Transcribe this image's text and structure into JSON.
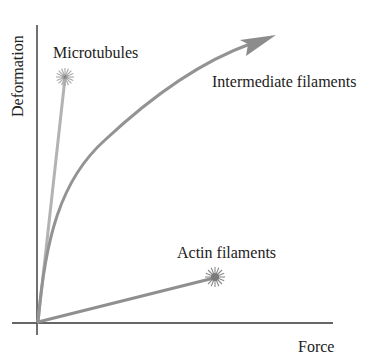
{
  "diagram": {
    "axes": {
      "x_label": "Force",
      "y_label": "Deformation",
      "axis_color": "#333333"
    },
    "curves": [
      {
        "name": "Microtubules",
        "label": "Microtubules",
        "shape": "straight line, steep, ends in burst (rupture)",
        "color": "#b3b3b3",
        "end_marker": "star-burst"
      },
      {
        "name": "Intermediate filaments",
        "label": "Intermediate filaments",
        "shape": "concave curve, ends in arrow (continues deforming without breaking)",
        "color": "#939393",
        "end_marker": "arrowhead"
      },
      {
        "name": "Actin filaments",
        "label": "Actin filaments",
        "shape": "straight line, shallow, ends in burst (rupture)",
        "color": "#8f8f8f",
        "end_marker": "star-burst"
      }
    ]
  }
}
